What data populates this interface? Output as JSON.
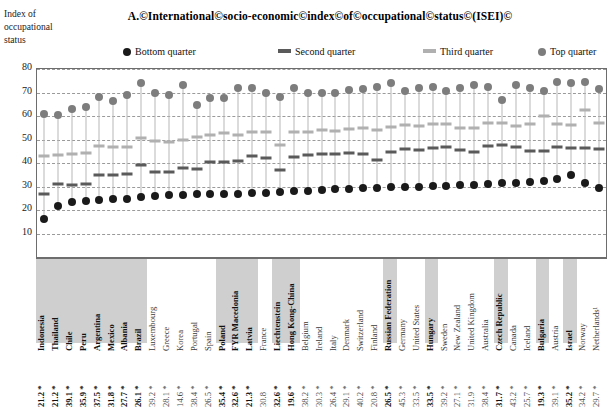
{
  "axis_caption": "Index of occupational status",
  "title": "A.©International©socio-economic©index©of©occupational©status©(ISEI)©",
  "legend": {
    "items": [
      {
        "label": "Bottom quarter",
        "marker": "dot",
        "color": "#1a1a1a"
      },
      {
        "label": "Second quarter",
        "marker": "bar",
        "color": "#5a5a5a"
      },
      {
        "label": "Third quarter",
        "marker": "bar",
        "color": "#b0b0b0"
      },
      {
        "label": "Top quarter",
        "marker": "dot",
        "color": "#7d7d7d"
      }
    ]
  },
  "chart_data": {
    "type": "scatter",
    "title": "A.©International©socio-economic©index©of©occupational©status©(ISEI)©",
    "xlabel": "",
    "ylabel": "Index of occupational status",
    "ylim": [
      0,
      80
    ],
    "yticks": [
      10,
      20,
      30,
      40,
      50,
      60,
      70,
      80
    ],
    "grid": true,
    "legend_position": "top",
    "categories": [
      "Indonesia",
      "Thailand",
      "Chile",
      "Peru",
      "Argentina",
      "Mexico",
      "Albania",
      "Brazil",
      "Luxembourg",
      "Greece",
      "Korea",
      "Portugal",
      "Spain",
      "Poland",
      "FYR Macedonia",
      "Latvia",
      "France",
      "Liechtenstein",
      "Hong Kong-China",
      "Belgium",
      "Ireland",
      "Italy",
      "Denmark",
      "Switzerland",
      "Finland",
      "Russian Federation",
      "Germany",
      "United States",
      "Hungary",
      "Sweden",
      "New Zealand",
      "United Kingdom",
      "Australia",
      "Czech Republic",
      "Canada",
      "Iceland",
      "Bulgaria",
      "Austria",
      "Israel",
      "Norway",
      "Netherlands¹"
    ],
    "highlighted_categories": [
      "Indonesia",
      "Thailand",
      "Chile",
      "Peru",
      "Argentina",
      "Mexico",
      "Albania",
      "Brazil",
      "Poland",
      "FYR Macedonia",
      "Latvia",
      "Liechtenstein",
      "Hong Kong-China",
      "Russian Federation",
      "Hungary",
      "Czech Republic",
      "Bulgaria",
      "Israel"
    ],
    "bottom_value_labels": [
      "21.2 *",
      "21.2 *",
      "39.1 *",
      "35.9 *",
      "37.5 *",
      "31.8 *",
      "27.7 *",
      "26.1 *",
      "39.2 *",
      "28.1 *",
      "14.6 *",
      "38.4 *",
      "26.5 *",
      "35.4 *",
      "32.6 *",
      "21.3 *",
      "30.8",
      "32.6 *",
      "19.6 *",
      "38.2 *",
      "30.3 *",
      "26.4 *",
      "29.1 *",
      "40.2 *",
      "20.8 *",
      "26.5 *",
      "45.3 *",
      "33.5 *",
      "33.5 *",
      "39.2 *",
      "27.1 *",
      "31.9 *",
      "38.4 *",
      "31.7 *",
      "43.2 *",
      "25.7 *",
      "19.3 *",
      "39.1 *",
      "35.2 *",
      "34.2 *",
      "29.7 *",
      "29.9 *"
    ],
    "series": [
      {
        "name": "Bottom quarter",
        "marker": "dot",
        "color": "#1a1a1a",
        "values": [
          16.2,
          21.5,
          23.2,
          23.8,
          24.4,
          24.6,
          24.8,
          25.6,
          26.0,
          26.2,
          26.4,
          26.6,
          26.6,
          26.8,
          27.0,
          27.2,
          27.4,
          27.8,
          28.0,
          28.2,
          28.5,
          28.8,
          29.0,
          29.2,
          29.4,
          29.6,
          29.8,
          30.0,
          30.2,
          30.4,
          30.6,
          30.8,
          31.2,
          31.4,
          31.6,
          32.0,
          32.4,
          33.2,
          35.0,
          31.6,
          29.4
        ]
      },
      {
        "name": "Second quarter",
        "marker": "bar",
        "color": "#5a5a5a",
        "values": [
          27.0,
          31.0,
          30.8,
          31.2,
          34.8,
          35.0,
          35.2,
          39.0,
          36.0,
          36.2,
          38.0,
          37.5,
          40.5,
          40.6,
          40.8,
          43.0,
          42.0,
          37.0,
          42.4,
          43.5,
          44.0,
          43.8,
          44.2,
          44.0,
          41.2,
          44.6,
          46.0,
          45.5,
          46.4,
          47.0,
          45.6,
          44.8,
          47.4,
          47.6,
          46.6,
          45.0,
          45.2,
          47.0,
          46.4,
          46.2,
          46.0
        ]
      },
      {
        "name": "Third quarter",
        "marker": "bar",
        "color": "#b0b0b0",
        "values": [
          43.0,
          43.5,
          44.0,
          44.2,
          47.2,
          47.0,
          46.8,
          50.5,
          49.2,
          49.0,
          50.0,
          51.2,
          52.0,
          52.6,
          52.0,
          53.2,
          53.0,
          47.8,
          53.0,
          53.4,
          54.0,
          53.8,
          54.6,
          54.8,
          54.2,
          55.4,
          56.0,
          55.6,
          56.4,
          56.6,
          55.0,
          54.8,
          57.2,
          57.0,
          55.6,
          56.8,
          60.0,
          56.6,
          56.2,
          62.4,
          57.0
        ]
      },
      {
        "name": "Top quarter",
        "marker": "dot",
        "color": "#7d7d7d",
        "values": [
          61.0,
          60.5,
          63.0,
          64.0,
          68.0,
          66.5,
          69.0,
          74.0,
          70.0,
          69.0,
          73.0,
          64.5,
          67.5,
          67.5,
          72.0,
          72.0,
          70.0,
          68.0,
          72.0,
          70.0,
          70.0,
          70.0,
          71.0,
          71.5,
          72.5,
          74.0,
          70.5,
          72.0,
          72.5,
          70.5,
          72.0,
          73.0,
          72.5,
          67.0,
          73.0,
          72.0,
          70.5,
          74.5,
          74.0,
          74.5,
          71.5
        ]
      }
    ]
  }
}
